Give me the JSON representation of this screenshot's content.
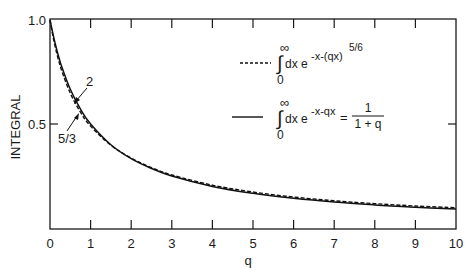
{
  "chart_data": {
    "type": "line",
    "title": "",
    "xlabel": "q",
    "ylabel": "INTEGRAL",
    "xlim": [
      0,
      10
    ],
    "ylim": [
      0,
      1.0
    ],
    "xticks": [
      "0",
      "1",
      "2",
      "3",
      "4",
      "5",
      "6",
      "7",
      "8",
      "9",
      "10"
    ],
    "yticks": [
      "0.5",
      "1.0"
    ],
    "grid": false,
    "legend_position": "upper-right-inside",
    "x": [
      0,
      0.1,
      0.2,
      0.3,
      0.5,
      0.75,
      1,
      1.5,
      2,
      2.5,
      3,
      4,
      5,
      6,
      7,
      8,
      9,
      10
    ],
    "series": [
      {
        "name": "∫0^∞ dx e^(-x-(qx)^(5/6))",
        "style": "dashed",
        "values": [
          1.0,
          0.895,
          0.815,
          0.75,
          0.648,
          0.557,
          0.49,
          0.398,
          0.336,
          0.29,
          0.255,
          0.206,
          0.173,
          0.149,
          0.131,
          0.117,
          0.106,
          0.097
        ]
      },
      {
        "name": "∫0^∞ dx e^(-x-qx) = 1/(1+q)",
        "style": "solid",
        "values": [
          1.0,
          0.909,
          0.833,
          0.769,
          0.667,
          0.571,
          0.5,
          0.4,
          0.333,
          0.286,
          0.25,
          0.2,
          0.167,
          0.143,
          0.125,
          0.111,
          0.1,
          0.0909
        ]
      }
    ],
    "annotations": [
      {
        "text": "2",
        "points_to": "solid curve near q≈0.65"
      },
      {
        "text": "5/3",
        "points_to": "dashed curve near q≈0.7"
      }
    ]
  },
  "axes": {
    "xlabel": "q",
    "ylabel": "INTEGRAL",
    "xticks": [
      "0",
      "1",
      "2",
      "3",
      "4",
      "5",
      "6",
      "7",
      "8",
      "9",
      "10"
    ],
    "yticks": {
      "top": "1.0",
      "mid": "0.5"
    }
  },
  "legend": {
    "dashed": {
      "upper_limit": "∞",
      "lower_limit": "0",
      "integrand": "dx e",
      "exponent": "-x-(qx)",
      "exponent_power": "5/6"
    },
    "solid": {
      "upper_limit": "∞",
      "lower_limit": "0",
      "integrand": "dx e",
      "exponent": "-x-qx",
      "equals": "=",
      "numerator": "1",
      "denominator": "1 + q"
    }
  },
  "annotations": {
    "label_2": "2",
    "label_5_3": "5/3"
  }
}
